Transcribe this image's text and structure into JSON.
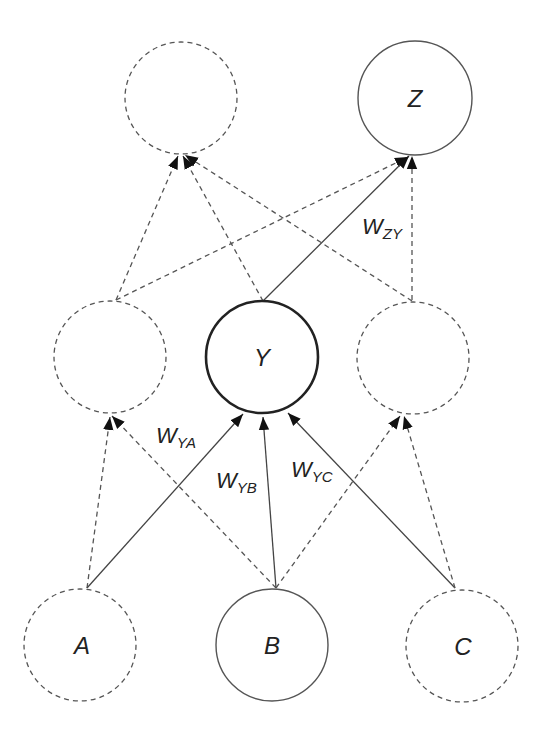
{
  "diagram": {
    "type": "neural-network-graph",
    "colors": {
      "stroke": "#555555",
      "highlight_stroke": "#222222",
      "arrow_fill": "#111111",
      "text": "#222222",
      "background": "#ffffff"
    },
    "nodes": [
      {
        "id": "top_left",
        "label": "",
        "cx": 181,
        "cy": 98,
        "r": 56,
        "style": "dashed"
      },
      {
        "id": "Z",
        "label": "Z",
        "cx": 415,
        "cy": 98,
        "r": 57,
        "style": "solid"
      },
      {
        "id": "mid_left",
        "label": "",
        "cx": 110,
        "cy": 357,
        "r": 56,
        "style": "dashed"
      },
      {
        "id": "Y",
        "label": "Y",
        "cx": 262,
        "cy": 357,
        "r": 56,
        "style": "bold"
      },
      {
        "id": "mid_right",
        "label": "",
        "cx": 413,
        "cy": 358,
        "r": 56,
        "style": "dashed"
      },
      {
        "id": "A",
        "label": "A",
        "cx": 80,
        "cy": 645,
        "r": 56,
        "style": "dashed"
      },
      {
        "id": "B",
        "label": "B",
        "cx": 272,
        "cy": 645,
        "r": 56,
        "style": "solid"
      },
      {
        "id": "C",
        "label": "C",
        "cx": 462,
        "cy": 646,
        "r": 56,
        "style": "dashed"
      }
    ],
    "edges": [
      {
        "from": "A",
        "to": "mid_left",
        "style": "dashed"
      },
      {
        "from": "B",
        "to": "mid_left",
        "style": "dashed"
      },
      {
        "from": "A",
        "to": "Y",
        "style": "solid",
        "label": "W",
        "sub": "YA"
      },
      {
        "from": "B",
        "to": "Y",
        "style": "solid",
        "label": "W",
        "sub": "YB"
      },
      {
        "from": "C",
        "to": "Y",
        "style": "solid",
        "label": "W",
        "sub": "YC"
      },
      {
        "from": "B",
        "to": "mid_right",
        "style": "dashed"
      },
      {
        "from": "C",
        "to": "mid_right",
        "style": "dashed"
      },
      {
        "from": "mid_left",
        "to": "top_left",
        "style": "dashed"
      },
      {
        "from": "Y",
        "to": "top_left",
        "style": "dashed"
      },
      {
        "from": "mid_right",
        "to": "top_left",
        "style": "dashed"
      },
      {
        "from": "mid_left",
        "to": "Z",
        "style": "dashed"
      },
      {
        "from": "Y",
        "to": "Z",
        "style": "solid",
        "label": "W",
        "sub": "ZY"
      },
      {
        "from": "mid_right",
        "to": "Z",
        "style": "dashed"
      }
    ],
    "weight_labels": {
      "w_ya": {
        "main": "W",
        "sub": "YA"
      },
      "w_yb": {
        "main": "W",
        "sub": "YB"
      },
      "w_yc": {
        "main": "W",
        "sub": "YC"
      },
      "w_zy": {
        "main": "W",
        "sub": "ZY"
      }
    },
    "node_labels": {
      "z": "Z",
      "y": "Y",
      "a": "A",
      "b": "B",
      "c": "C"
    }
  }
}
